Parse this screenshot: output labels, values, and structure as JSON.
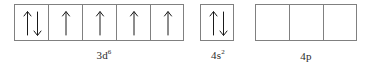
{
  "diagram": {
    "box_width": 34,
    "box_height": 37,
    "border_color": "#808080",
    "arrow_color": "#1a1a1a",
    "background": "#ffffff",
    "groups": [
      {
        "id": "3d",
        "label_text": "3d",
        "label_superscript": "6",
        "electron_count": 6,
        "box_count": 5,
        "boxes": [
          {
            "spins": [
              "up",
              "down"
            ]
          },
          {
            "spins": [
              "up"
            ]
          },
          {
            "spins": [
              "up"
            ]
          },
          {
            "spins": [
              "up"
            ]
          },
          {
            "spins": [
              "up"
            ]
          }
        ]
      },
      {
        "id": "4s",
        "label_text": "4s",
        "label_superscript": "2",
        "electron_count": 2,
        "box_count": 1,
        "boxes": [
          {
            "spins": [
              "up",
              "down"
            ]
          }
        ]
      },
      {
        "id": "4p",
        "label_text": "4p",
        "label_superscript": "",
        "electron_count": 0,
        "box_count": 3,
        "boxes": [
          {
            "spins": []
          },
          {
            "spins": []
          },
          {
            "spins": []
          }
        ]
      }
    ]
  }
}
